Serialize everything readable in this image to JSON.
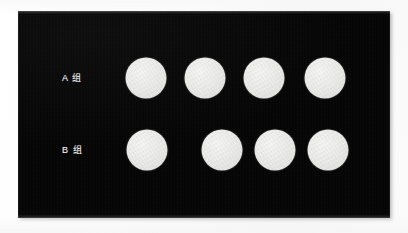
{
  "image": {
    "width": 408,
    "height": 233,
    "background_color": "#ffffff"
  },
  "panel": {
    "name": "dot-comparison-panel",
    "background_color": "#050505",
    "x": 18,
    "y": 11,
    "width": 372,
    "height": 207
  },
  "style": {
    "dot_color": "#ececea",
    "label_color": "#f2f2f2"
  },
  "rows": [
    {
      "id": "row-a",
      "label": "A 组",
      "label_x": 62,
      "center_y": 78,
      "count": 4,
      "dot_diameter": 41,
      "dots": [
        {
          "id": "a1",
          "cx": 146,
          "cy": 78,
          "d": 41
        },
        {
          "id": "a2",
          "cx": 205,
          "cy": 78,
          "d": 41
        },
        {
          "id": "a3",
          "cx": 264,
          "cy": 78,
          "d": 41
        },
        {
          "id": "a4",
          "cx": 325,
          "cy": 78,
          "d": 41
        }
      ]
    },
    {
      "id": "row-b",
      "label": "B 组",
      "label_x": 62,
      "center_y": 150,
      "count": 4,
      "dot_diameter": 41,
      "dots": [
        {
          "id": "b1",
          "cx": 147,
          "cy": 150,
          "d": 41
        },
        {
          "id": "b2",
          "cx": 222,
          "cy": 150,
          "d": 41
        },
        {
          "id": "b3",
          "cx": 275,
          "cy": 150,
          "d": 41
        },
        {
          "id": "b4",
          "cx": 328,
          "cy": 150,
          "d": 41
        }
      ]
    }
  ]
}
